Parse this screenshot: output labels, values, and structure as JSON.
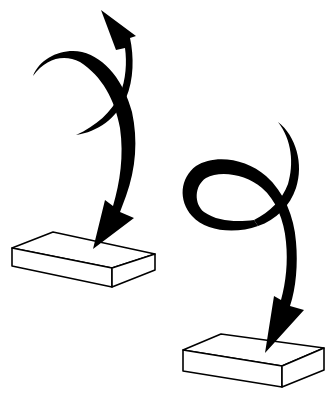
{
  "diagram": {
    "description": "Two illustrations of curved black arrows landing on flat rectangular blocks",
    "colors": {
      "background": "#ffffff",
      "ink": "#000000",
      "block_fill": "#ffffff"
    },
    "figures": [
      {
        "name": "crossed-arrows-onto-block",
        "arrows": [
          {
            "name": "arrow-down-to-block",
            "direction": "down"
          },
          {
            "name": "arrow-up",
            "direction": "up-left"
          }
        ],
        "block": {
          "label": ""
        }
      },
      {
        "name": "looped-arrow-onto-block",
        "arrows": [
          {
            "name": "looping-arrow-down-to-block",
            "direction": "down"
          }
        ],
        "block": {
          "label": ""
        }
      }
    ]
  }
}
